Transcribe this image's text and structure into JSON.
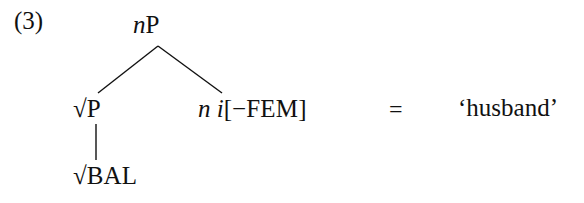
{
  "figure": {
    "example_number": "(3)",
    "background_color": "#ffffff",
    "ink_color": "#111111"
  },
  "tree": {
    "root": {
      "label_italic": "n",
      "label_roman": "P",
      "full_label": "nP"
    },
    "left_daughter": {
      "radical": "√",
      "label_roman": "P",
      "full_label": "√P"
    },
    "left_granddaughter": {
      "radical": "√",
      "label_smallcaps": "BAL",
      "full_label": "√BAL"
    },
    "right_daughter": {
      "head_italic": "n",
      "index_italic": "i",
      "bracket_open": "[",
      "feature_value": "−",
      "feature_name": "FEM",
      "bracket_close": "]",
      "full_label": "n i[−FEM]"
    }
  },
  "equation": {
    "equals": "=",
    "gloss": "‘husband’"
  }
}
